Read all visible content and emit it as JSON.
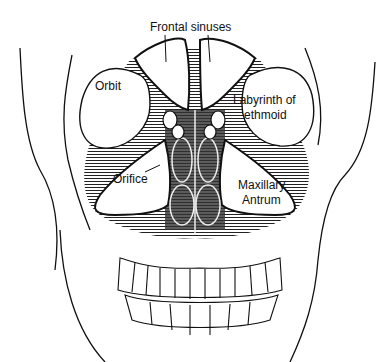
{
  "diagram": {
    "type": "anatomical-illustration",
    "colors": {
      "ink": "#111111",
      "shading": "#555555",
      "background": "#ffffff"
    },
    "labels": {
      "frontal_sinuses": "Frontal sinuses",
      "orbit": "Orbit",
      "labyrinth_line1": "Labyrinth of",
      "labyrinth_line2": "ethmoid",
      "orifice": "Orifice",
      "maxillary_line1": "Maxillary",
      "maxillary_line2": "Antrum"
    }
  }
}
